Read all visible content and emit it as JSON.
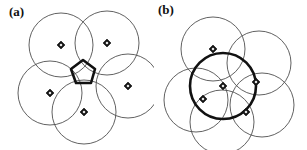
{
  "figure": {
    "width": 307,
    "height": 150,
    "background": "#ffffff",
    "line_color": "#4f4f4f",
    "bold_color": "#111111",
    "marker_color": "#141414"
  },
  "panels": [
    {
      "id": "a",
      "label": "(a)",
      "description": "five overlapping thin circles surrounding a bold pentagon",
      "highlight": "pentagon"
    },
    {
      "id": "b",
      "label": "(b)",
      "description": "five overlapping thin circles with one bold circle drawn over them",
      "highlight": "circle"
    }
  ],
  "chart_data": {
    "type": "scatter",
    "title": "",
    "xlabel": "",
    "ylabel": "",
    "xlim": [
      0,
      307
    ],
    "ylim": [
      0,
      150
    ],
    "grid": false,
    "legend": null,
    "panels": [
      {
        "name": "(a)",
        "circle_radius": 32,
        "circles": [
          {
            "cx": 61,
            "cy": 45
          },
          {
            "cx": 107,
            "cy": 43
          },
          {
            "cx": 128,
            "cy": 86
          },
          {
            "cx": 84,
            "cy": 112
          },
          {
            "cx": 50,
            "cy": 93
          }
        ],
        "markers": [
          {
            "cx": 61,
            "cy": 45
          },
          {
            "cx": 107,
            "cy": 43
          },
          {
            "cx": 128,
            "cy": 86
          },
          {
            "cx": 84,
            "cy": 112
          },
          {
            "cx": 50,
            "cy": 93
          }
        ],
        "highlight_shape": {
          "kind": "pentagon",
          "cx": 83,
          "cy": 73,
          "r": 13,
          "rotation_deg": -18,
          "points": "83,60 95,69 91,83 76,83 71,69"
        }
      },
      {
        "name": "(b)",
        "circle_radius": 32,
        "circles": [
          {
            "cx": 213,
            "cy": 49
          },
          {
            "cx": 259,
            "cy": 63
          },
          {
            "cx": 262,
            "cy": 105
          },
          {
            "cx": 222,
            "cy": 122
          },
          {
            "cx": 196,
            "cy": 100
          }
        ],
        "markers": [
          {
            "cx": 213,
            "cy": 49
          },
          {
            "cx": 256,
            "cy": 82
          },
          {
            "cx": 246,
            "cy": 112
          },
          {
            "cx": 203,
            "cy": 99
          },
          {
            "cx": 223,
            "cy": 86
          }
        ],
        "highlight_shape": {
          "kind": "circle",
          "cx": 223,
          "cy": 86,
          "r": 33
        }
      }
    ]
  }
}
